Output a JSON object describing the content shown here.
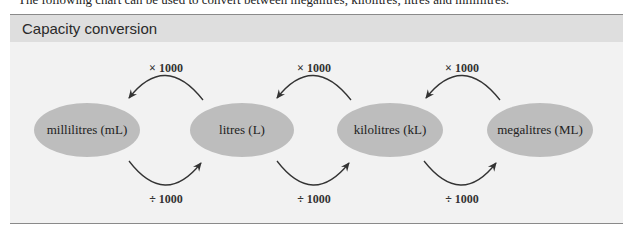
{
  "intro_text": "The following chart can be used to convert between megalitres, kilolitres, litres and millilitres.",
  "panel": {
    "title": "Capacity conversion"
  },
  "units": [
    {
      "label": "millilitres (mL)",
      "cx": 87,
      "cy": 130
    },
    {
      "label": "litres (L)",
      "cx": 242,
      "cy": 130
    },
    {
      "label": "kilolitres (kL)",
      "cx": 390,
      "cy": 130
    },
    {
      "label": "megalitres (ML)",
      "cx": 540,
      "cy": 130
    }
  ],
  "conversions": {
    "multiply": [
      {
        "label": "× 1000",
        "from": "litres (L)",
        "to": "millilitres (mL)"
      },
      {
        "label": "× 1000",
        "from": "kilolitres (kL)",
        "to": "litres (L)"
      },
      {
        "label": "× 1000",
        "from": "megalitres (ML)",
        "to": "kilolitres (kL)"
      }
    ],
    "divide": [
      {
        "label": "÷ 1000",
        "from": "millilitres (mL)",
        "to": "litres (L)"
      },
      {
        "label": "÷ 1000",
        "from": "litres (L)",
        "to": "kilolitres (kL)"
      },
      {
        "label": "÷ 1000",
        "from": "kilolitres (kL)",
        "to": "megalitres (ML)"
      }
    ]
  },
  "colors": {
    "ellipse_fill": "#bdbdbd",
    "panel_bg": "#f2f2f2",
    "header_bg": "#dedede",
    "arrow": "#333333"
  }
}
